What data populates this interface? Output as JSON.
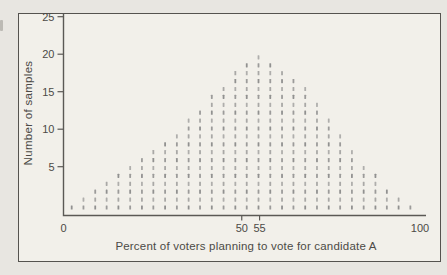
{
  "colors": {
    "page_bg": "#e8e6e1",
    "frame_bg": "#f2f0ea",
    "frame_border": "#55534f",
    "axis": "#5b5955",
    "dash": "#868686",
    "text": "#4c4a46"
  },
  "chart_data": {
    "type": "bar",
    "variant": "stacked-dash-histogram",
    "title": "",
    "xlabel": "Percent of voters planning to vote for candidate A",
    "ylabel": "Number of samples",
    "xlim": [
      0,
      100
    ],
    "ylim": [
      0,
      25
    ],
    "grid": false,
    "legend": false,
    "note": "each short dash in a column represents one sample",
    "x": [
      2.3,
      5.6,
      8.9,
      12.1,
      15.4,
      18.7,
      22.0,
      25.2,
      28.5,
      31.8,
      35.1,
      38.3,
      41.6,
      44.9,
      48.2,
      51.4,
      54.7,
      58.0,
      61.3,
      64.5,
      67.8,
      71.1,
      74.4,
      77.6,
      80.9,
      84.2,
      87.5,
      90.7,
      94.0,
      97.3
    ],
    "counts": [
      1,
      2,
      3,
      4,
      5,
      6,
      7,
      8,
      9,
      10,
      12,
      13,
      15,
      16,
      18,
      19,
      20,
      19,
      18,
      17,
      16,
      14,
      12,
      10,
      8,
      6,
      5,
      3,
      2,
      1
    ],
    "x_ticks": [
      {
        "value": 0,
        "label": "0",
        "tick": false
      },
      {
        "value": 50,
        "label": "50",
        "tick": true
      },
      {
        "value": 55,
        "label": "55",
        "tick": true
      },
      {
        "value": 100,
        "label": "100",
        "tick": false
      }
    ],
    "y_ticks": [
      {
        "value": 5,
        "label": "5"
      },
      {
        "value": 10,
        "label": "10"
      },
      {
        "value": 15,
        "label": "15"
      },
      {
        "value": 20,
        "label": "20"
      },
      {
        "value": 25,
        "label": "25"
      }
    ]
  }
}
